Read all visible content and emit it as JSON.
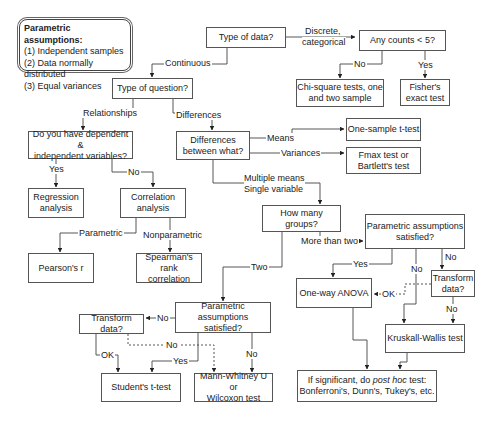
{
  "legend": {
    "title": "Parametric assumptions:",
    "items": [
      "(1) Independent samples",
      "(2) Data normally distributed",
      "(3) Equal variances"
    ]
  },
  "nodes": {
    "type_of_data": "Type of data?",
    "any_counts": "Any counts < 5?",
    "chi_square_1": "Chi-square tests, one",
    "chi_square_2": "and two sample",
    "fisher_1": "Fisher's",
    "fisher_2": "exact test",
    "type_of_question": "Type of question?",
    "dep_indep_1": "Do you have dependent &",
    "dep_indep_2": "independent variables?",
    "diff_between_1": "Differences",
    "diff_between_2": "between what?",
    "one_sample": "One-sample t-test",
    "fmax_1": "Fmax test or",
    "fmax_2": "Bartlett's test",
    "regression_1": "Regression",
    "regression_2": "analysis",
    "correlation_1": "Correlation",
    "correlation_2": "analysis",
    "pearson": "Pearson's r",
    "spearman_1": "Spearman's rank",
    "spearman_2": "correlation",
    "how_many_groups": "How many groups?",
    "param_sat_right_1": "Parametric assumptions",
    "param_sat_right_2": "satisfied?",
    "one_way_anova": "One-way ANOVA",
    "transform_right_1": "Transform",
    "transform_right_2": "data?",
    "kruskal": "Kruskall-Wallis test",
    "posthoc_1a": "If significant, do ",
    "posthoc_1b": "post hoc",
    "posthoc_1c": " test:",
    "posthoc_2": "Bonferroni's, Dunn's, Tukey's, etc.",
    "param_sat_left_1": "Parametric assumptions",
    "param_sat_left_2": "satisfied?",
    "transform_left": "Transform data?",
    "students_t": "Student's t-test",
    "mann_whitney_1": "Mann-Whitney U or",
    "mann_whitney_2": "Wilcoxon test"
  },
  "edge_labels": {
    "discrete_1": "Discrete,",
    "discrete_2": "categorical",
    "continuous": "Continuous",
    "counts_no": "No",
    "counts_yes": "Yes",
    "relationships": "Relationships",
    "differences": "Differences",
    "dep_yes": "Yes",
    "dep_no": "No",
    "means": "Means",
    "variances": "Variances",
    "multiple_1": "Multiple means",
    "multiple_2": "Single variable",
    "parametric": "Parametric",
    "nonparametric": "Nonparametric",
    "more_than_two": "More than two",
    "two": "Two",
    "right_yes": "Yes",
    "right_no": "No",
    "right_no_transform": "No",
    "right_ok": "OK",
    "right_transform_no": "No",
    "left_no": "No",
    "left_ok": "OK",
    "left_yes": "Yes",
    "left_dashed_no": "No",
    "left_no_mw": "No"
  }
}
